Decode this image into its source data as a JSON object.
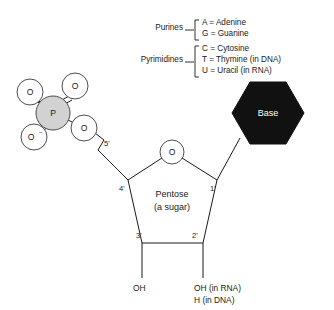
{
  "diagram": {
    "legend": {
      "groups": [
        {
          "name": "Purines",
          "label_x": 183,
          "label_y": 30,
          "bracket_x": 196,
          "bracket_top": 20,
          "bracket_bottom": 40,
          "entries": [
            {
              "text": "A = Adenine",
              "x": 202,
              "y": 25
            },
            {
              "text": "G = Guanine",
              "x": 202,
              "y": 36
            }
          ]
        },
        {
          "name": "Pyrimidines",
          "label_x": 163,
          "label_y": 62,
          "bracket_x": 196,
          "bracket_top": 46,
          "bracket_bottom": 78,
          "entries": [
            {
              "text": "C = Cytosine",
              "x": 202,
              "y": 51
            },
            {
              "text": "T = Thymine (in DNA)",
              "x": 202,
              "y": 62
            },
            {
              "text": "U = Uracil (in RNA)",
              "x": 202,
              "y": 73
            }
          ]
        }
      ]
    },
    "phosphate": {
      "center_label": "P",
      "center": {
        "x": 53,
        "y": 113,
        "r": 17
      },
      "oxygens": [
        {
          "label": "O",
          "x": 30,
          "y": 92,
          "r": 13,
          "charge": ""
        },
        {
          "label": "O",
          "x": 75,
          "y": 86,
          "r": 13,
          "charge": ""
        },
        {
          "label": "O",
          "x": 34,
          "y": 137,
          "r": 13,
          "charge": "−"
        },
        {
          "label": "O",
          "x": 84,
          "y": 128,
          "r": 13,
          "charge": ""
        }
      ]
    },
    "sugar": {
      "name_line1": "Pentose",
      "name_line2": "(a sugar)",
      "name_x": 172,
      "name_y1": 194,
      "name_y2": 208,
      "ring_oxygen": {
        "label": "O",
        "x": 172,
        "y": 152,
        "r": 12
      },
      "vertices": {
        "c1": {
          "x": 217,
          "y": 180
        },
        "c2": {
          "x": 203,
          "y": 243
        },
        "c3": {
          "x": 142,
          "y": 243
        },
        "c4": {
          "x": 128,
          "y": 180
        }
      },
      "carbon_labels": [
        {
          "text": "5'",
          "x": 108,
          "y": 143
        },
        {
          "text": "4'",
          "x": 123,
          "y": 190
        },
        {
          "text": "3'",
          "x": 140,
          "y": 237
        },
        {
          "text": "2'",
          "x": 194,
          "y": 237
        },
        {
          "text": "1'",
          "x": 212,
          "y": 190
        }
      ]
    },
    "base": {
      "label": "Base",
      "center_x": 268,
      "center_y": 113,
      "radius": 36
    },
    "terminals": [
      {
        "lines": [
          "OH"
        ],
        "x": 133,
        "y": 288
      },
      {
        "lines": [
          "OH (in RNA)",
          "H (in DNA)"
        ],
        "x": 194,
        "y": 288
      }
    ],
    "colors": {
      "phosphorus_fill": "#d2d2d2",
      "base_fill": "#111111",
      "base_text": "#ffffff",
      "stroke": "#1a1a1a",
      "background": "#ffffff"
    }
  }
}
